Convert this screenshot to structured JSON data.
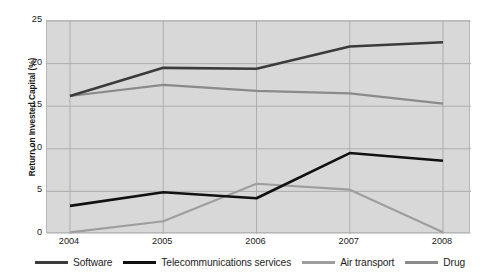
{
  "chart_data": {
    "type": "line",
    "title": "",
    "xlabel": "",
    "ylabel": "Return on Invested Capital (%)",
    "categories": [
      "2004",
      "2005",
      "2006",
      "2007",
      "2008"
    ],
    "x": [
      2004,
      2005,
      2006,
      2007,
      2008
    ],
    "xlim": [
      2004,
      2008
    ],
    "ylim": [
      0,
      25
    ],
    "yticks": [
      0,
      5,
      10,
      15,
      20,
      25
    ],
    "ytick_labels": [
      "0",
      "5",
      "10",
      "15",
      "20",
      "25"
    ],
    "grid": true,
    "legend_position": "bottom",
    "plot_background": "#d8d8d8",
    "series": [
      {
        "name": "Software",
        "color": "#3b3b3b",
        "width": 2.6,
        "values": [
          16.2,
          19.5,
          19.4,
          22.0,
          22.5
        ]
      },
      {
        "name": "Telecommunications services",
        "color": "#111111",
        "width": 2.6,
        "values": [
          3.3,
          4.9,
          4.2,
          9.5,
          8.6
        ]
      },
      {
        "name": "Air transport",
        "color": "#9e9e9e",
        "width": 2.2,
        "values": [
          0.2,
          1.5,
          5.9,
          5.2,
          0.2
        ]
      },
      {
        "name": "Drug",
        "color": "#8a8a8a",
        "width": 2.2,
        "values": [
          16.2,
          17.5,
          16.8,
          16.5,
          15.3
        ]
      }
    ]
  },
  "legend": {
    "items": [
      {
        "label": "Software",
        "color": "#3b3b3b"
      },
      {
        "label": "Telecommunications services",
        "color": "#111111"
      },
      {
        "label": "Air transport",
        "color": "#9e9e9e"
      },
      {
        "label": "Drug",
        "color": "#8a8a8a"
      }
    ]
  }
}
